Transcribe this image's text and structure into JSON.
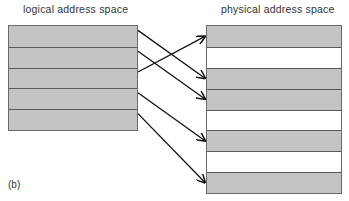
{
  "figure": {
    "label": "(b)",
    "logical": {
      "title": "logical address space",
      "blocks": [
        {
          "index": 0,
          "shaded": true
        },
        {
          "index": 1,
          "shaded": true
        },
        {
          "index": 2,
          "shaded": true
        },
        {
          "index": 3,
          "shaded": true
        },
        {
          "index": 4,
          "shaded": true
        }
      ]
    },
    "physical": {
      "title": "physical address space",
      "blocks": [
        {
          "index": 0,
          "shaded": true
        },
        {
          "index": 1,
          "shaded": false
        },
        {
          "index": 2,
          "shaded": true
        },
        {
          "index": 3,
          "shaded": true
        },
        {
          "index": 4,
          "shaded": false
        },
        {
          "index": 5,
          "shaded": true
        },
        {
          "index": 6,
          "shaded": false
        },
        {
          "index": 7,
          "shaded": true
        }
      ]
    },
    "mapping": [
      {
        "from": 0,
        "to": 2
      },
      {
        "from": 1,
        "to": 3
      },
      {
        "from": 2,
        "to": 0
      },
      {
        "from": 3,
        "to": 5
      },
      {
        "from": 4,
        "to": 7
      }
    ],
    "colors": {
      "shaded": "#c4c4c4",
      "border": "#5a5a5a",
      "arrow": "#111111"
    }
  }
}
